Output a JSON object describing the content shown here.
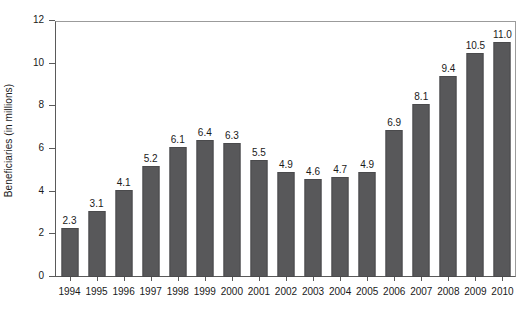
{
  "chart_data": {
    "type": "bar",
    "title": "",
    "xlabel": "",
    "ylabel": "Beneficiaries (in millions)",
    "categories": [
      "1994",
      "1995",
      "1996",
      "1997",
      "1998",
      "1999",
      "2000",
      "2001",
      "2002",
      "2003",
      "2004",
      "2005",
      "2006",
      "2007",
      "2008",
      "2009",
      "2010"
    ],
    "values": [
      2.3,
      3.1,
      4.1,
      5.2,
      6.1,
      6.4,
      6.3,
      5.5,
      4.9,
      4.6,
      4.7,
      4.9,
      6.9,
      8.1,
      9.4,
      10.5,
      11.0
    ],
    "value_labels": [
      "2.3",
      "3.1",
      "4.1",
      "5.2",
      "6.1",
      "6.4",
      "6.3",
      "5.5",
      "4.9",
      "4.6",
      "4.7",
      "4.9",
      "6.9",
      "8.1",
      "9.4",
      "10.5",
      "11.0"
    ],
    "ylim": [
      0,
      12
    ],
    "y_ticks": [
      0,
      2,
      4,
      6,
      8,
      10,
      12
    ],
    "y_tick_labels": [
      "0",
      "2",
      "4",
      "6",
      "8",
      "10",
      "12"
    ],
    "grid": false,
    "legend": null,
    "legend_position": "none",
    "bar_color": "#58585a",
    "bar_edge_color": "#4a4a4c",
    "axis_color": "#5a5a5a",
    "text_color": "#1a1a1a",
    "background_color": "#ffffff",
    "data_labels_shown": true
  }
}
